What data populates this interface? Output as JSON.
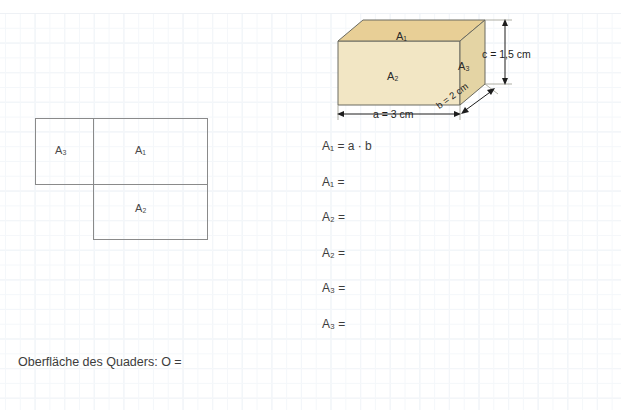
{
  "page": {
    "background": "graph-paper",
    "grid_color": "#e8edf3",
    "clipped_header_text": ""
  },
  "solid": {
    "type": "cuboid",
    "caption_labels": {
      "top_face": "A₁",
      "front_face": "A₂",
      "side_face": "A₃"
    },
    "colors": {
      "top_face": "#e8cf96",
      "front_face": "#f2e6c4",
      "side_face": "#e4d4a4",
      "outline": "#5a5a52"
    },
    "dimensions": [
      {
        "name": "a",
        "label": "a = 3 cm",
        "value": 3,
        "unit": "cm"
      },
      {
        "name": "b",
        "label": "b = 2 cm",
        "value": 2,
        "unit": "cm"
      },
      {
        "name": "c",
        "label": "c = 1,5 cm",
        "value": 1.5,
        "unit": "cm"
      }
    ]
  },
  "net": {
    "title": "",
    "outline_color": "#8a8a8a",
    "faces": [
      {
        "id": "A3",
        "label": "A₃"
      },
      {
        "id": "A1",
        "label": "A₁"
      },
      {
        "id": "A2",
        "label": "A₂"
      }
    ]
  },
  "equations": [
    {
      "lhs": "A",
      "sub": "1",
      "rhs": " = a · b",
      "full": "A₁ = a · b"
    },
    {
      "lhs": "A",
      "sub": "1",
      "rhs": " =",
      "full": "A₁ ="
    },
    {
      "lhs": "A",
      "sub": "2",
      "rhs": " =",
      "full": "A₂ ="
    },
    {
      "lhs": "A",
      "sub": "2",
      "rhs": " =",
      "full": "A₂ ="
    },
    {
      "lhs": "A",
      "sub": "3",
      "rhs": " =",
      "full": "A₃ ="
    },
    {
      "lhs": "A",
      "sub": "3",
      "rhs": " =",
      "full": "A₃ ="
    }
  ],
  "footer": {
    "text": "Oberfläche des Quaders:  O ="
  }
}
